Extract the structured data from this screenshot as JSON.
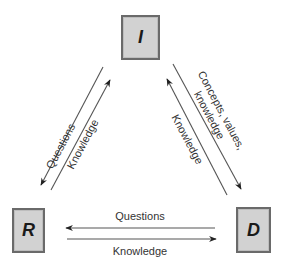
{
  "diagram": {
    "type": "triangle-flow",
    "colors": {
      "box_fill": "#d2d2d2",
      "box_border": "#6a6a6a",
      "line": "#555555",
      "text": "#333333"
    },
    "nodes": [
      {
        "id": "I",
        "label": "I"
      },
      {
        "id": "R",
        "label": "R"
      },
      {
        "id": "D",
        "label": "D"
      }
    ],
    "edges": {
      "I_to_R": {
        "label": "Questions",
        "from": "I",
        "to": "R"
      },
      "R_to_I": {
        "label": "Knowledge",
        "from": "R",
        "to": "I"
      },
      "I_to_D": {
        "label_line1": "Concepts, values,",
        "label_line2": "knowledge",
        "from": "I",
        "to": "D"
      },
      "D_to_I": {
        "label": "Knowledge",
        "from": "D",
        "to": "I"
      },
      "D_to_R": {
        "label": "Questions",
        "from": "D",
        "to": "R"
      },
      "R_to_D": {
        "label": "Knowledge",
        "from": "R",
        "to": "D"
      }
    }
  }
}
